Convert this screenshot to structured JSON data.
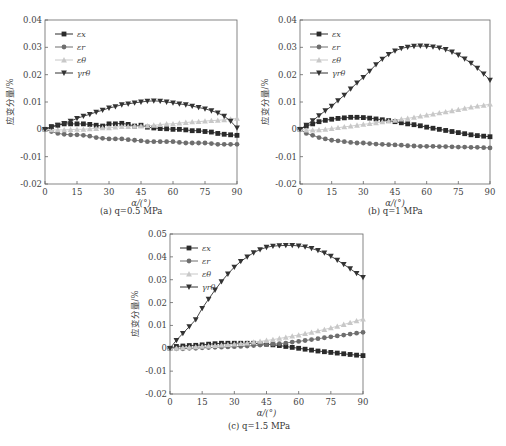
{
  "colors": {
    "ex": "#2a2a2a",
    "er": "#6e6e6e",
    "etheta": "#c8c8c8",
    "gamma": "#333333",
    "axis": "#666666"
  },
  "chart_data": [
    {
      "id": "a",
      "type": "line",
      "title": "",
      "caption": "(a)  q=0.5 MPa",
      "xlabel": "α/(°)",
      "ylabel": "应变分量/%",
      "xlim": [
        0,
        90
      ],
      "ylim": [
        -0.02,
        0.04
      ],
      "xticks": [
        0,
        15,
        30,
        45,
        60,
        75,
        90
      ],
      "yticks": [
        -0.02,
        -0.01,
        0,
        0.01,
        0.02,
        0.03,
        0.04
      ],
      "ytick_labels": [
        "-0.02",
        "-0.01",
        "0",
        "0.01",
        "0.02",
        "0.03",
        "0.04"
      ],
      "grid": false,
      "legend_position": "upper-left",
      "x": [
        0,
        3,
        6,
        9,
        12,
        15,
        18,
        21,
        24,
        27,
        30,
        33,
        36,
        39,
        42,
        45,
        48,
        51,
        54,
        57,
        60,
        63,
        66,
        69,
        72,
        75,
        78,
        81,
        84,
        87,
        90
      ],
      "series": [
        {
          "name": "εx",
          "key": "ex",
          "marker": "square",
          "values": [
            0,
            0.001,
            0.0015,
            0.002,
            0.002,
            0.002,
            0.002,
            0.0018,
            0.0015,
            0.0012,
            0.002,
            0.002,
            0.0022,
            0.0018,
            0.0012,
            0.0015,
            0.0008,
            0.0005,
            0.0003,
            0.0002,
            0.0,
            0.0,
            -0.0002,
            -0.0005,
            -0.0005,
            -0.0008,
            -0.001,
            -0.0015,
            -0.0018,
            -0.002,
            -0.0022
          ]
        },
        {
          "name": "εr",
          "key": "er",
          "marker": "circle",
          "values": [
            0,
            -0.0008,
            -0.0015,
            -0.0018,
            -0.002,
            -0.002,
            -0.0022,
            -0.0025,
            -0.003,
            -0.0033,
            -0.0035,
            -0.0035,
            -0.0035,
            -0.0038,
            -0.004,
            -0.0042,
            -0.0045,
            -0.0045,
            -0.0045,
            -0.0045,
            -0.0045,
            -0.0048,
            -0.005,
            -0.005,
            -0.005,
            -0.005,
            -0.0052,
            -0.0055,
            -0.0055,
            -0.0055,
            -0.0055
          ]
        },
        {
          "name": "εθ",
          "key": "etheta",
          "marker": "triangle-up",
          "values": [
            0,
            -0.0002,
            -0.0002,
            -0.0002,
            -0.0001,
            0,
            0,
            0.0002,
            0.0003,
            0.0005,
            0.0005,
            0.0008,
            0.001,
            0.001,
            0.0012,
            0.0012,
            0.0013,
            0.0015,
            0.0017,
            0.002,
            0.002,
            0.0023,
            0.0025,
            0.0027,
            0.0028,
            0.003,
            0.0032,
            0.0033,
            0.0035,
            0.0037,
            0.004
          ]
        },
        {
          "name": "γrθ",
          "key": "gamma",
          "marker": "triangle-down",
          "values": [
            0,
            0.0008,
            0.0015,
            0.0022,
            0.003,
            0.004,
            0.0048,
            0.0055,
            0.0063,
            0.007,
            0.0078,
            0.0083,
            0.009,
            0.0093,
            0.0097,
            0.01,
            0.0103,
            0.0104,
            0.0103,
            0.01,
            0.0097,
            0.0093,
            0.009,
            0.0085,
            0.008,
            0.0075,
            0.0068,
            0.006,
            0.0048,
            0.003,
            0.0005
          ]
        }
      ]
    },
    {
      "id": "b",
      "type": "line",
      "title": "",
      "caption": "(b)  q=1 MPa",
      "xlabel": "α/(°)",
      "ylabel": "应变分量/%",
      "xlim": [
        0,
        90
      ],
      "ylim": [
        -0.02,
        0.04
      ],
      "xticks": [
        0,
        15,
        30,
        45,
        60,
        75,
        90
      ],
      "yticks": [
        -0.02,
        -0.01,
        0,
        0.01,
        0.02,
        0.03,
        0.04
      ],
      "ytick_labels": [
        "-0.02",
        "-0.01",
        "0",
        "0.01",
        "0.02",
        "0.03",
        "0.04"
      ],
      "grid": false,
      "legend_position": "upper-left",
      "x": [
        0,
        3,
        6,
        9,
        12,
        15,
        18,
        21,
        24,
        27,
        30,
        33,
        36,
        39,
        42,
        45,
        48,
        51,
        54,
        57,
        60,
        63,
        66,
        69,
        72,
        75,
        78,
        81,
        84,
        87,
        90
      ],
      "series": [
        {
          "name": "εx",
          "key": "ex",
          "marker": "square",
          "values": [
            0,
            0.0012,
            0.002,
            0.0028,
            0.0033,
            0.0037,
            0.004,
            0.0042,
            0.0044,
            0.0044,
            0.0043,
            0.0041,
            0.0038,
            0.0035,
            0.0032,
            0.0028,
            0.0024,
            0.002,
            0.0017,
            0.0013,
            0.0008,
            0.0004,
            0.0,
            -0.0004,
            -0.0008,
            -0.0012,
            -0.0016,
            -0.002,
            -0.0023,
            -0.0025,
            -0.0027
          ]
        },
        {
          "name": "εr",
          "key": "er",
          "marker": "circle",
          "values": [
            0,
            -0.0015,
            -0.0022,
            -0.003,
            -0.0035,
            -0.004,
            -0.0042,
            -0.0045,
            -0.0048,
            -0.005,
            -0.005,
            -0.0052,
            -0.0054,
            -0.0055,
            -0.0056,
            -0.0057,
            -0.0058,
            -0.006,
            -0.0061,
            -0.0062,
            -0.0062,
            -0.0062,
            -0.0063,
            -0.0063,
            -0.0064,
            -0.0065,
            -0.0065,
            -0.0066,
            -0.0066,
            -0.0067,
            -0.0068
          ]
        },
        {
          "name": "εθ",
          "key": "etheta",
          "marker": "triangle-up",
          "values": [
            0,
            -0.0003,
            -0.0003,
            -0.0002,
            0,
            0.0003,
            0.0006,
            0.0009,
            0.0012,
            0.0015,
            0.0018,
            0.0021,
            0.0024,
            0.0027,
            0.003,
            0.0033,
            0.0037,
            0.004,
            0.0044,
            0.0048,
            0.0052,
            0.0056,
            0.006,
            0.0064,
            0.0068,
            0.0072,
            0.0077,
            0.0081,
            0.0085,
            0.0088,
            0.0092
          ]
        },
        {
          "name": "γrθ",
          "key": "gamma",
          "marker": "triangle-down",
          "values": [
            0,
            0.0015,
            0.0032,
            0.005,
            0.0068,
            0.0085,
            0.0105,
            0.0125,
            0.0148,
            0.017,
            0.019,
            0.0213,
            0.0237,
            0.0257,
            0.0274,
            0.0287,
            0.0296,
            0.0301,
            0.0304,
            0.0305,
            0.0304,
            0.0302,
            0.0298,
            0.0292,
            0.0283,
            0.0272,
            0.0258,
            0.0242,
            0.0224,
            0.0203,
            0.018
          ]
        }
      ]
    },
    {
      "id": "c",
      "type": "line",
      "title": "",
      "caption": "(c)  q=1.5 MPa",
      "xlabel": "α/(°)",
      "ylabel": "应变分量/%",
      "xlim": [
        0,
        90
      ],
      "ylim": [
        -0.02,
        0.05
      ],
      "xticks": [
        0,
        15,
        30,
        45,
        60,
        75,
        90
      ],
      "yticks": [
        -0.02,
        -0.01,
        0,
        0.01,
        0.02,
        0.03,
        0.04,
        0.05
      ],
      "ytick_labels": [
        "-0.02",
        "-0.01",
        "0",
        "0.01",
        "0.02",
        "0.03",
        "0.04",
        "0.05"
      ],
      "grid": false,
      "legend_position": "upper-left",
      "x": [
        0,
        3,
        6,
        9,
        12,
        15,
        18,
        21,
        24,
        27,
        30,
        33,
        36,
        39,
        42,
        45,
        48,
        51,
        54,
        57,
        60,
        63,
        66,
        69,
        72,
        75,
        78,
        81,
        84,
        87,
        90
      ],
      "series": [
        {
          "name": "εx",
          "key": "ex",
          "marker": "square",
          "values": [
            0,
            0.0008,
            0.001,
            0.0012,
            0.0013,
            0.0015,
            0.0018,
            0.002,
            0.0022,
            0.0022,
            0.0022,
            0.0022,
            0.0022,
            0.0022,
            0.002,
            0.0018,
            0.0015,
            0.0012,
            0.0008,
            0.0004,
            0.0,
            -0.0004,
            -0.0008,
            -0.0012,
            -0.0015,
            -0.0018,
            -0.0021,
            -0.0024,
            -0.0027,
            -0.003,
            -0.0032
          ]
        },
        {
          "name": "εr",
          "key": "er",
          "marker": "circle",
          "values": [
            0,
            -0.0002,
            -0.0002,
            0.0,
            0.0,
            0.0002,
            0.0003,
            0.0004,
            0.0005,
            0.0006,
            0.0007,
            0.0008,
            0.001,
            0.0012,
            0.0014,
            0.0016,
            0.0018,
            0.002,
            0.0023,
            0.0027,
            0.003,
            0.0034,
            0.0038,
            0.0042,
            0.0046,
            0.005,
            0.0054,
            0.0058,
            0.0062,
            0.0066,
            0.007
          ]
        },
        {
          "name": "εθ",
          "key": "etheta",
          "marker": "triangle-up",
          "values": [
            0,
            0.0,
            0.0002,
            0.0004,
            0.0006,
            0.0008,
            0.001,
            0.0012,
            0.0014,
            0.0016,
            0.0018,
            0.002,
            0.0023,
            0.0027,
            0.003,
            0.0034,
            0.0038,
            0.0043,
            0.0048,
            0.0053,
            0.0058,
            0.0064,
            0.007,
            0.0076,
            0.0082,
            0.0089,
            0.0096,
            0.0104,
            0.0112,
            0.012,
            0.0128
          ]
        },
        {
          "name": "γrθ",
          "key": "gamma",
          "marker": "triangle-down",
          "values": [
            0,
            0.0035,
            0.0065,
            0.0095,
            0.0125,
            0.0175,
            0.0215,
            0.0255,
            0.0292,
            0.0325,
            0.0355,
            0.038,
            0.04,
            0.0418,
            0.0432,
            0.0442,
            0.0447,
            0.0449,
            0.045,
            0.045,
            0.0448,
            0.0444,
            0.0437,
            0.0428,
            0.0417,
            0.0403,
            0.0386,
            0.0367,
            0.0348,
            0.0328,
            0.031
          ]
        }
      ]
    }
  ]
}
